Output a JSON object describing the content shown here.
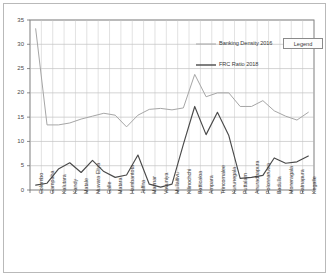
{
  "figure": {
    "legend_box_label": "Legend"
  },
  "chart_data": {
    "type": "line",
    "title": "",
    "xlabel": "",
    "ylabel": "",
    "ylim": [
      0,
      35
    ],
    "yticks": [
      0,
      5,
      10,
      15,
      20,
      25,
      30,
      35
    ],
    "grid": true,
    "legend_position": "upper-right-inside",
    "categories": [
      "Colombo",
      "Gampaha",
      "Kalutara",
      "Kandy",
      "Matale",
      "Nuwara Eliya",
      "Galle",
      "Matara",
      "Hambantota",
      "Jaffna",
      "Mannar",
      "Vavuniya",
      "Mullaitivu",
      "Kilinochchi",
      "Batticaloa",
      "Ampara",
      "Trincomalee",
      "Kurunegala",
      "Puttalam",
      "Anuradhapura",
      "Polonnaruwa",
      "Badulla",
      "Moneragala",
      "Ratnapura",
      "Kegalle"
    ],
    "series": [
      {
        "name": "Banking Density 2016",
        "color": "#a6a6a6",
        "values": [
          33.2,
          13.4,
          13.4,
          13.8,
          14.6,
          15.2,
          15.8,
          15.4,
          13.0,
          15.4,
          16.6,
          16.8,
          16.5,
          16.9,
          23.8,
          19.2,
          20.0,
          20.0,
          17.2,
          17.2,
          18.4,
          16.3,
          15.2,
          14.4,
          16.0
        ]
      },
      {
        "name": "FRC Ratio 2018",
        "color": "#4a4a4a",
        "values": [
          1.0,
          1.4,
          4.3,
          5.6,
          3.6,
          6.1,
          3.8,
          2.6,
          3.1,
          7.2,
          1.2,
          0.6,
          1.2,
          9.4,
          17.2,
          11.4,
          16.0,
          11.2,
          2.4,
          2.6,
          3.0,
          6.6,
          5.5,
          5.8,
          7.0
        ]
      }
    ]
  }
}
